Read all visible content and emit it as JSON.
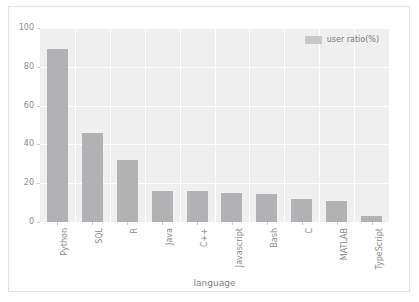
{
  "chart_data": {
    "type": "bar",
    "title": "",
    "xlabel": "language",
    "ylabel": "",
    "categories": [
      "Python",
      "SQL",
      "R",
      "Java",
      "C++",
      "Javascript",
      "Bash",
      "C",
      "MATLAB",
      "TypeScript"
    ],
    "values": [
      89,
      46,
      32,
      16,
      16,
      15,
      14.5,
      12,
      11,
      3
    ],
    "series": [
      {
        "name": "user ratio(%)",
        "values": [
          89,
          46,
          32,
          16,
          16,
          15,
          14.5,
          12,
          11,
          3
        ]
      }
    ],
    "ylim": [
      0,
      100
    ],
    "yticks": [
      0,
      20,
      40,
      60,
      80,
      100
    ],
    "ytick_labels": [
      "0",
      "20",
      "40",
      "60",
      "80",
      "100"
    ],
    "grid": true,
    "legend_position": "upper right",
    "bar_color": "#b2b2b4",
    "plot_background": "#efeff0",
    "gridline_color": "#ffffff",
    "tick_label_color": "#8b8b8b"
  },
  "legend": {
    "entries": [
      {
        "label": "user ratio(%)",
        "color": "#c8c8c9"
      }
    ]
  },
  "axes": {
    "x_title": "language",
    "y_title": ""
  }
}
